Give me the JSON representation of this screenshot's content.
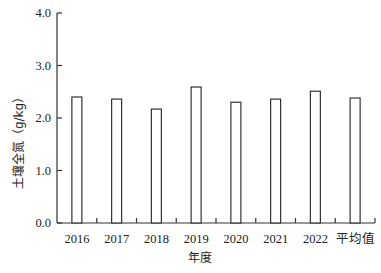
{
  "chart_data": {
    "type": "bar",
    "title": "",
    "xlabel": "年度",
    "ylabel": "土壤全氮（g/kg）",
    "categories": [
      "2016",
      "2017",
      "2018",
      "2019",
      "2020",
      "2021",
      "2022",
      "平均值"
    ],
    "values": [
      2.4,
      2.36,
      2.17,
      2.59,
      2.3,
      2.36,
      2.51,
      2.38
    ],
    "ylim": [
      0,
      4.0
    ],
    "yticks": [
      "0.0",
      "1.0",
      "2.0",
      "3.0",
      "4.0"
    ],
    "grid": false,
    "legend": null,
    "bar_style": {
      "fill": "#ffffff",
      "stroke": "#333333"
    }
  }
}
